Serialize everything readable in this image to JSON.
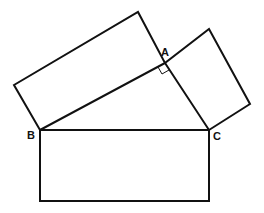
{
  "diagram": {
    "labels": {
      "A": "A",
      "B": "B",
      "C": "C"
    },
    "points": {
      "A": [
        165,
        63
      ],
      "B": [
        40,
        130
      ],
      "C": [
        209,
        130
      ]
    },
    "stroke_color": "#111111",
    "background": "#ffffff"
  }
}
